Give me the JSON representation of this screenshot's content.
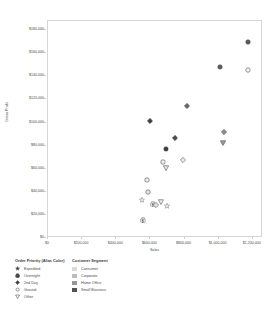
{
  "chart_data": {
    "type": "scatter",
    "title": "",
    "xlabel": "Sales",
    "ylabel": "Gross Profit",
    "xlim": [
      0,
      1260000
    ],
    "ylim": [
      0,
      188000
    ],
    "grid": false,
    "legend_position": "bottom-left",
    "xticks": [
      "$0",
      "$200,000",
      "$400,000",
      "$600,000",
      "$800,000",
      "$1,000,000",
      "$1,200,000"
    ],
    "xtick_values": [
      0,
      200000,
      400000,
      600000,
      800000,
      1000000,
      1200000
    ],
    "yticks": [
      "$0",
      "$20,000",
      "$40,000",
      "$60,000",
      "$80,000",
      "$100,000",
      "$120,000",
      "$140,000",
      "$160,000",
      "$180,000"
    ],
    "ytick_values": [
      0,
      20000,
      40000,
      60000,
      80000,
      100000,
      120000,
      140000,
      160000,
      180000
    ],
    "encodings": {
      "shape": "Order Priority (Alias Color)",
      "color": "Customer Segment"
    },
    "points": [
      {
        "x": 1175000,
        "y": 176000,
        "shape": "Ground",
        "segment": "Small Business",
        "color": "#595959"
      },
      {
        "x": 1008000,
        "y": 155000,
        "shape": "Ground",
        "segment": "Small Business",
        "color": "#5f5f5f"
      },
      {
        "x": 1170000,
        "y": 152000,
        "shape": "Ground",
        "segment": "Consumer",
        "color": "#f2f2f2"
      },
      {
        "x": 812000,
        "y": 121000,
        "shape": "2nd Day",
        "segment": "Corporate",
        "color": "#6b6b6b"
      },
      {
        "x": 596000,
        "y": 108000,
        "shape": "2nd Day",
        "segment": "Small Business",
        "color": "#3f3f3f"
      },
      {
        "x": 1032000,
        "y": 98000,
        "shape": "2nd Day",
        "segment": "Home Office",
        "color": "#8f8f8f"
      },
      {
        "x": 742000,
        "y": 93000,
        "shape": "2nd Day",
        "segment": "Small Business",
        "color": "#4b4b4b"
      },
      {
        "x": 1028000,
        "y": 89000,
        "shape": "Other",
        "segment": "Home Office",
        "color": "#9a9a9a"
      },
      {
        "x": 690000,
        "y": 84000,
        "shape": "Ground",
        "segment": "Small Business",
        "color": "#3b3b3b"
      },
      {
        "x": 790000,
        "y": 74000,
        "shape": "2nd Day",
        "segment": "Consumer",
        "color": "#ebebeb"
      },
      {
        "x": 672000,
        "y": 72000,
        "shape": "Ground",
        "segment": "Consumer",
        "color": "#ededed"
      },
      {
        "x": 692000,
        "y": 67000,
        "shape": "Other",
        "segment": "Consumer",
        "color": "#e6e6e6"
      },
      {
        "x": 582000,
        "y": 57000,
        "shape": "Ground",
        "segment": "Consumer",
        "color": "#ececec"
      },
      {
        "x": 588000,
        "y": 46000,
        "shape": "Ground",
        "segment": "Consumer",
        "color": "#e4e4e4"
      },
      {
        "x": 548000,
        "y": 39000,
        "shape": "Expedited",
        "segment": "Consumer",
        "color": "#ededed"
      },
      {
        "x": 660000,
        "y": 38000,
        "shape": "Other",
        "segment": "Consumer",
        "color": "#eaeaea"
      },
      {
        "x": 616000,
        "y": 36000,
        "shape": "Overnight",
        "segment": "Consumer",
        "color": "#e8e8e8"
      },
      {
        "x": 634000,
        "y": 35000,
        "shape": "2nd Day",
        "segment": "Consumer",
        "color": "#e4e4e4"
      },
      {
        "x": 700000,
        "y": 34000,
        "shape": "Expedited",
        "segment": "Consumer",
        "color": "#ebebeb"
      },
      {
        "x": 556000,
        "y": 22000,
        "shape": "Overnight",
        "segment": "Consumer",
        "color": "#e2e2e2"
      }
    ]
  },
  "legend": {
    "shape_legend": {
      "title": "Order Priority (Alias Color)",
      "items": [
        {
          "label": "Expedited",
          "marker": "star-marker"
        },
        {
          "label": "Overnight",
          "marker": "club-marker"
        },
        {
          "label": "2nd Day",
          "marker": "diamond-marker"
        },
        {
          "label": "Ground",
          "marker": "circle-marker"
        },
        {
          "label": "Other",
          "marker": "triangle-down-marker"
        }
      ]
    },
    "color_legend": {
      "title": "Customer Segment",
      "items": [
        {
          "label": "Consumer",
          "color": "#d9d9d9"
        },
        {
          "label": "Corporate",
          "color": "#bdbdbd"
        },
        {
          "label": "Home Office",
          "color": "#969696"
        },
        {
          "label": "Small Business",
          "color": "#525252"
        }
      ]
    }
  }
}
